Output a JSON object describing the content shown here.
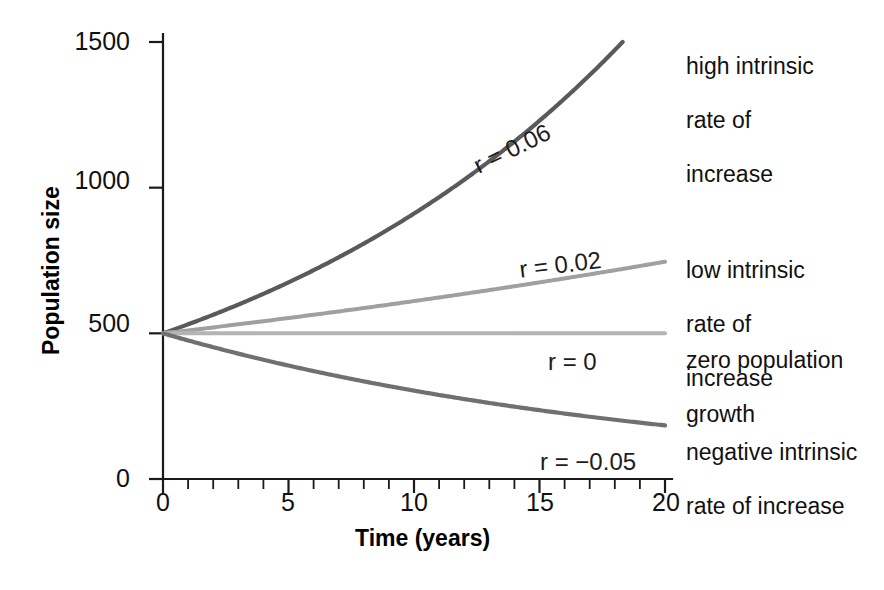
{
  "chart_data": {
    "type": "line",
    "title": "",
    "subtitle": "",
    "xlabel": "Time (years)",
    "ylabel": "Population size",
    "xlim": [
      0,
      20
    ],
    "ylim": [
      0,
      1500
    ],
    "grid": false,
    "legend_position": "right-annotations",
    "x_ticks": [
      0,
      5,
      10,
      15,
      20
    ],
    "x_tick_labels": [
      "0",
      "5",
      "10",
      "15",
      "20"
    ],
    "x_minor_tick_step": 1,
    "y_ticks": [
      0,
      500,
      1000,
      1500
    ],
    "y_tick_labels": [
      "0",
      "500",
      "1000",
      "1500"
    ],
    "initial_population": 500,
    "x": [
      0,
      1,
      2,
      3,
      4,
      5,
      6,
      7,
      8,
      9,
      10,
      11,
      12,
      13,
      14,
      15,
      16,
      17,
      18,
      19,
      20
    ],
    "series": [
      {
        "name": "high intrinsic rate of increase",
        "r": 0.06,
        "inline_label": "r = 0.06",
        "color": "#5a5a5a",
        "stroke_width": 4.2,
        "values": [
          500,
          531,
          564,
          599,
          636,
          675,
          717,
          761,
          808,
          858,
          911,
          967,
          1027,
          1090,
          1158,
          1229,
          1305,
          1386,
          1471,
          1562,
          1660
        ]
      },
      {
        "name": "low intrinsic rate of increase",
        "r": 0.02,
        "inline_label": "r = 0.02",
        "color": "#a0a0a0",
        "stroke_width": 4.0,
        "values": [
          500,
          510,
          520,
          531,
          542,
          553,
          564,
          575,
          586,
          598,
          611,
          623,
          636,
          648,
          662,
          675,
          689,
          703,
          717,
          731,
          746
        ]
      },
      {
        "name": "zero population growth",
        "r": 0,
        "inline_label": "r = 0",
        "color": "#b4b4b4",
        "stroke_width": 4.0,
        "values": [
          500,
          499,
          499,
          498,
          498,
          497,
          497,
          496,
          496,
          495,
          495,
          494,
          494,
          493,
          493,
          492,
          492,
          491,
          491,
          490,
          490
        ]
      },
      {
        "name": "negative intrinsic rate of increase",
        "r": -0.05,
        "inline_label": "r = −0.05",
        "color": "#707070",
        "stroke_width": 4.2,
        "values": [
          500,
          459,
          425,
          394,
          366,
          341,
          318,
          297,
          278,
          261,
          245,
          231,
          218,
          206,
          195,
          186,
          177,
          169,
          162,
          156,
          150
        ]
      }
    ],
    "annotations": [
      {
        "id": "high",
        "text": "high intrinsic\nrate of\nincrease"
      },
      {
        "id": "low",
        "text": "low intrinsic\nrate of\nincrease"
      },
      {
        "id": "zero",
        "text": "zero population\ngrowth"
      },
      {
        "id": "negative",
        "text": "negative intrinsic\nrate of increase"
      }
    ]
  },
  "axes": {
    "y_title": "Population size",
    "x_title": "Time (years)",
    "y_labels": {
      "t1500": "1500",
      "t1000": "1000",
      "t500": "500",
      "t0": "0"
    },
    "x_labels": {
      "t0": "0",
      "t5": "5",
      "t10": "10",
      "t15": "15",
      "t20": "20"
    }
  },
  "inline_labels": {
    "r006": "r = 0.06",
    "r002": "r = 0.02",
    "r000": "r = 0",
    "rneg005": "r = −0.05"
  },
  "side_annotations": {
    "high_line1": "high intrinsic",
    "high_line2": "rate of",
    "high_line3": "increase",
    "low_line1": "low intrinsic",
    "low_line2": "rate of",
    "low_line3": "increase",
    "zero_line1": "zero population",
    "zero_line2": "growth",
    "neg_line1": "negative intrinsic",
    "neg_line2": "rate of increase"
  },
  "colors": {
    "axis": "#1a1a1a",
    "curve_high": "#5a5a5a",
    "curve_low": "#a0a0a0",
    "curve_zero": "#b4b4b4",
    "curve_negative": "#707070",
    "background": "#ffffff",
    "text": "#111111"
  }
}
